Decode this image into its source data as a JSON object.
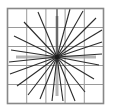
{
  "figure": {
    "canvas": {
      "width": 125,
      "height": 111,
      "background": "#ffffff"
    },
    "frame": {
      "x": 7.5,
      "y": 8.5,
      "width": 96,
      "height": 95,
      "stroke": "#888888",
      "stroke_width": 1.6,
      "fill": "#ffffff"
    },
    "grid": {
      "rows": 5,
      "cols": 5,
      "stroke": "#9a9a9a",
      "stroke_width": 1.0,
      "x_positions": [
        26.7,
        45.9,
        65.1,
        84.3
      ],
      "y_positions": [
        27.5,
        46.5,
        65.5,
        84.5
      ]
    },
    "center": {
      "x": 57,
      "y": 57,
      "dot_radius": 2.2,
      "dot_color": "#1a1a1a"
    },
    "axis_lines": {
      "stroke": "#b5b5b5",
      "stroke_width": 3.0,
      "segments": [
        {
          "name": "axis-up",
          "x1": 57,
          "y1": 57,
          "x2": 57,
          "y2": 16
        },
        {
          "name": "axis-down",
          "x1": 57,
          "y1": 57,
          "x2": 57,
          "y2": 96
        },
        {
          "name": "axis-left",
          "x1": 57,
          "y1": 57,
          "x2": 16,
          "y2": 57
        },
        {
          "name": "axis-right",
          "x1": 57,
          "y1": 57,
          "x2": 96,
          "y2": 57
        }
      ]
    },
    "rays": {
      "stroke": "#2b2b2b",
      "stroke_width": 1.1,
      "count": 22,
      "endpoints": [
        {
          "x": 57,
          "y": 9
        },
        {
          "x": 70,
          "y": 9
        },
        {
          "x": 83,
          "y": 11
        },
        {
          "x": 96,
          "y": 18
        },
        {
          "x": 102,
          "y": 30
        },
        {
          "x": 102,
          "y": 42
        },
        {
          "x": 102,
          "y": 54
        },
        {
          "x": 99,
          "y": 65
        },
        {
          "x": 94,
          "y": 79
        },
        {
          "x": 85,
          "y": 92
        },
        {
          "x": 75,
          "y": 101
        },
        {
          "x": 63,
          "y": 101
        },
        {
          "x": 52,
          "y": 101
        },
        {
          "x": 40,
          "y": 99
        },
        {
          "x": 28,
          "y": 95
        },
        {
          "x": 17,
          "y": 86
        },
        {
          "x": 10,
          "y": 74
        },
        {
          "x": 9,
          "y": 62
        },
        {
          "x": 11,
          "y": 50
        },
        {
          "x": 14,
          "y": 36
        },
        {
          "x": 24,
          "y": 22
        },
        {
          "x": 38,
          "y": 12
        }
      ]
    }
  }
}
